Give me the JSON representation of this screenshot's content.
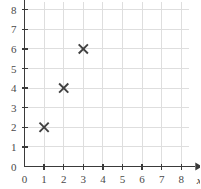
{
  "chart_data": {
    "type": "scatter",
    "title": "",
    "subtitle": "",
    "xlabel": "x",
    "ylabel": "y",
    "xlim": [
      0,
      8
    ],
    "ylim": [
      0,
      8
    ],
    "grid": true,
    "legend": null,
    "marker_symbol": "x",
    "x": [
      1,
      2,
      3
    ],
    "y": [
      2,
      4,
      6
    ],
    "points": [
      {
        "x": 1,
        "y": 2
      },
      {
        "x": 2,
        "y": 4
      },
      {
        "x": 3,
        "y": 6
      }
    ],
    "xticks": [
      "0",
      "1",
      "2",
      "3",
      "4",
      "5",
      "6",
      "7",
      "8"
    ],
    "yticks": [
      "0",
      "1",
      "2",
      "3",
      "4",
      "5",
      "6",
      "7",
      "8"
    ],
    "xtick_values": [
      0,
      1,
      2,
      3,
      4,
      5,
      6,
      7,
      8
    ],
    "ytick_values": [
      0,
      1,
      2,
      3,
      4,
      5,
      6,
      7,
      8
    ],
    "colors": {
      "background": "#ffffff",
      "grid": "#dedede",
      "axis": "#3a3a3a",
      "marker": "#404040",
      "tick_label": "#4a4a4a"
    }
  }
}
